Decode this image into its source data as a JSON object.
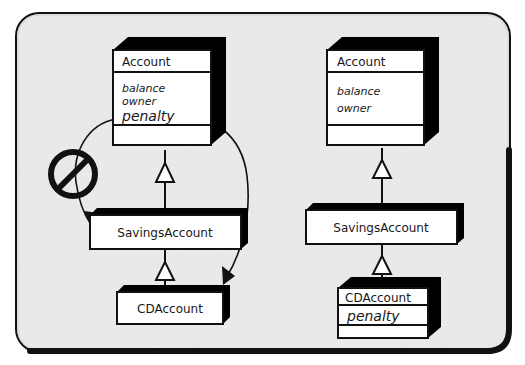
{
  "figure": {
    "kind": "uml-class-diagram",
    "caption": "",
    "frame": {
      "border_color": "#111111",
      "background_color": "#eeeeee",
      "corner_radius": 22
    }
  },
  "palette": {
    "line": "#111111",
    "box_fill": "#ffffff",
    "box_shadow": "#000000",
    "paper": "#eeeeee",
    "paper_speckle": "#dcdcdc"
  },
  "variants": [
    {
      "id": "incorrect",
      "name": "left-variant",
      "annotation": {
        "symbol": "prohibition-sign",
        "label": "no-symbol"
      },
      "classes": [
        {
          "id": "account-left",
          "name": "Account",
          "attributes": [
            "balance",
            "owner",
            "penalty"
          ],
          "emphasized_attribute": "penalty",
          "operations": [],
          "has_operation_compartment": true
        },
        {
          "id": "savings-left",
          "name": "SavingsAccount",
          "attributes": [],
          "operations": [],
          "has_operation_compartment": false
        },
        {
          "id": "cd-left",
          "name": "CDAccount",
          "attributes": [],
          "operations": [],
          "has_operation_compartment": false
        }
      ],
      "relations": [
        {
          "type": "generalization",
          "from": "savings-left",
          "to": "account-left",
          "marker": "hollow-triangle"
        },
        {
          "type": "generalization",
          "from": "cd-left",
          "to": "savings-left",
          "marker": "hollow-triangle"
        },
        {
          "type": "move-annotation",
          "from": "account-left",
          "to": "savings-left",
          "marker": "open-arrow",
          "note": "penalty pulled down to SavingsAccount"
        },
        {
          "type": "move-annotation",
          "from": "account-left",
          "to": "cd-left",
          "marker": "open-arrow",
          "note": "penalty pulled down to CDAccount"
        }
      ]
    },
    {
      "id": "correct",
      "name": "right-variant",
      "annotation": null,
      "classes": [
        {
          "id": "account-right",
          "name": "Account",
          "attributes": [
            "balance",
            "owner"
          ],
          "emphasized_attribute": null,
          "operations": [],
          "has_operation_compartment": true
        },
        {
          "id": "savings-right",
          "name": "SavingsAccount",
          "attributes": [],
          "operations": [],
          "has_operation_compartment": false
        },
        {
          "id": "cd-right",
          "name": "CDAccount",
          "attributes": [
            "penalty"
          ],
          "emphasized_attribute": "penalty",
          "operations": [],
          "has_operation_compartment": true
        }
      ],
      "relations": [
        {
          "type": "generalization",
          "from": "savings-right",
          "to": "account-right",
          "marker": "hollow-triangle"
        },
        {
          "type": "generalization",
          "from": "cd-right",
          "to": "savings-right",
          "marker": "hollow-triangle"
        }
      ]
    }
  ],
  "labels": {
    "account_left_title": "Account",
    "account_left_attr_1": "balance",
    "account_left_attr_2": "owner",
    "account_left_attr_3": "penalty",
    "savings_left_title": "SavingsAccount",
    "cd_left_title": "CDAccount",
    "account_right_title": "Account",
    "account_right_attr_1": "balance",
    "account_right_attr_2": "owner",
    "savings_right_title": "SavingsAccount",
    "cd_right_title": "CDAccount",
    "cd_right_attr_1": "penalty"
  }
}
